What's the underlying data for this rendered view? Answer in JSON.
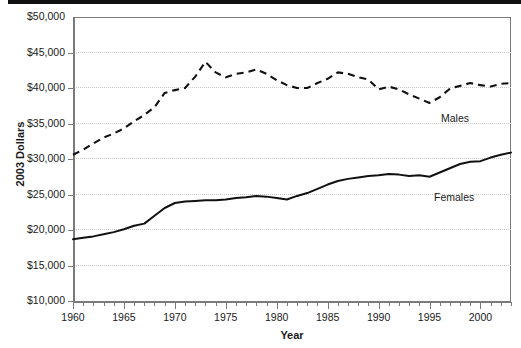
{
  "chart_data": {
    "type": "line",
    "title": "",
    "subtitle": "",
    "xlabel": "Year",
    "ylabel": "2003 Dollars",
    "xlim": [
      1960,
      2003
    ],
    "ylim": [
      10000,
      50000
    ],
    "grid": true,
    "legend_position": "inline-annotation",
    "y_ticks": [
      10000,
      15000,
      20000,
      25000,
      30000,
      35000,
      40000,
      45000,
      50000
    ],
    "y_tick_labels": [
      "$10,000",
      "$15,000",
      "$20,000",
      "$25,000",
      "$30,000",
      "$35,000",
      "$40,000",
      "$45,000",
      "$50,000"
    ],
    "x_ticks_major": [
      1960,
      1965,
      1970,
      1975,
      1980,
      1985,
      1990,
      1995,
      2000
    ],
    "x_tick_labels": [
      "1960",
      "1965",
      "1970",
      "1975",
      "1980",
      "1985",
      "1990",
      "1995",
      "2000"
    ],
    "x_minor_tick_step": 1,
    "x": [
      1960,
      1961,
      1962,
      1963,
      1964,
      1965,
      1966,
      1967,
      1968,
      1969,
      1970,
      1971,
      1972,
      1973,
      1974,
      1975,
      1976,
      1977,
      1978,
      1979,
      1980,
      1981,
      1982,
      1983,
      1984,
      1985,
      1986,
      1987,
      1988,
      1989,
      1990,
      1991,
      1992,
      1993,
      1994,
      1995,
      1996,
      1997,
      1998,
      1999,
      2000,
      2001,
      2002,
      2003
    ],
    "series": [
      {
        "name": "Males",
        "style": "dashed",
        "color": "#111111",
        "annotation": "Males",
        "values": [
          30600,
          31300,
          32200,
          33000,
          33600,
          34300,
          35300,
          36200,
          37300,
          39300,
          39700,
          40000,
          41600,
          43700,
          42200,
          41500,
          42000,
          42200,
          42600,
          42000,
          41100,
          40400,
          40000,
          40000,
          40700,
          41300,
          42200,
          42000,
          41500,
          41200,
          39800,
          40200,
          39800,
          39100,
          38500,
          37900,
          38700,
          39900,
          40300,
          40700,
          40400,
          40200,
          40600,
          40700
        ]
      },
      {
        "name": "Females",
        "style": "solid",
        "color": "#111111",
        "annotation": "Females",
        "values": [
          18700,
          18900,
          19100,
          19400,
          19700,
          20100,
          20600,
          20900,
          22000,
          23100,
          23800,
          24000,
          24100,
          24200,
          24200,
          24300,
          24500,
          24600,
          24800,
          24700,
          24500,
          24300,
          24800,
          25200,
          25800,
          26400,
          26900,
          27200,
          27400,
          27600,
          27700,
          27900,
          27800,
          27600,
          27700,
          27500,
          28100,
          28700,
          29300,
          29600,
          29700,
          30200,
          30600,
          30900
        ]
      }
    ]
  }
}
